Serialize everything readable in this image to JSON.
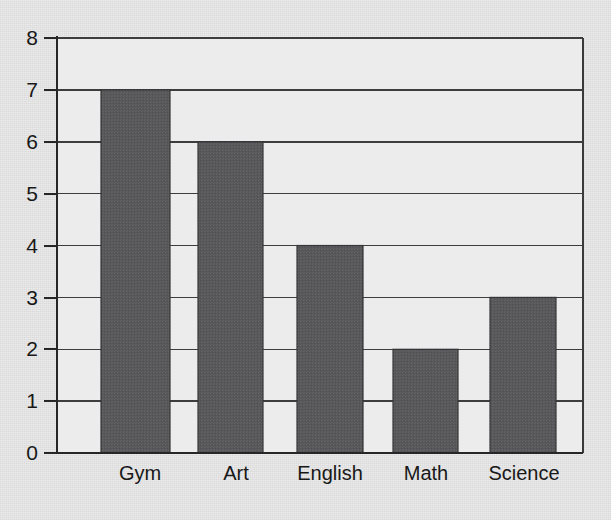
{
  "chart_data": {
    "type": "bar",
    "title": "",
    "subtitle": "",
    "xlabel": "",
    "ylabel": "",
    "categories": [
      "Gym",
      "Art",
      "English",
      "Math",
      "Science"
    ],
    "values": [
      7,
      6,
      4,
      2,
      3
    ],
    "series": [
      {
        "name": "",
        "values": [
          7,
          6,
          4,
          2,
          3
        ]
      }
    ],
    "ylim": [
      0,
      8
    ],
    "y_ticks": [
      0,
      1,
      2,
      3,
      4,
      5,
      6,
      7,
      8
    ],
    "y_tick_labels": [
      "0",
      "1",
      "2",
      "3",
      "4",
      "5",
      "6",
      "7",
      "8"
    ],
    "grid": "horizontal",
    "legend": "none",
    "annotations": [],
    "colors": {
      "bar_fill": "#58585a",
      "bar_edge": "#343436",
      "background": "#e9e9e9",
      "axis": "#262626",
      "grid": "#3d3d3d",
      "text": "#181818"
    }
  },
  "axis": {
    "y_tick_labels": [
      "8",
      "7",
      "6",
      "5",
      "4",
      "3",
      "2",
      "1",
      "0"
    ],
    "x_tick_labels": [
      "Gym",
      "Art",
      "English",
      "Math",
      "Science"
    ]
  }
}
